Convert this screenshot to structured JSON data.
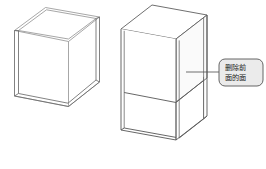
{
  "figure": {
    "background_color": "#ffffff",
    "line_color": "#6b6b6b",
    "line_color_dark": "#4a4a4a",
    "face_fill": "#ffffff",
    "shading_fill": "#f7f7f7"
  },
  "objects": [
    {
      "name": "left-box-wireframe",
      "label": "wireframe shell box",
      "style": "transparent thin-walled open box, all edges visible"
    },
    {
      "name": "right-box-solid",
      "label": "shaded shell box with front face removed",
      "style": "opaque faces, front face deleted revealing interior"
    }
  ],
  "callout": {
    "text_line_1": "删除前",
    "text_line_2": "面的面",
    "full_text": "删除前面的面",
    "fill_color": "#ebebeb",
    "border_color": "#555555",
    "leader_line": "connects callout to right box right vertical edge"
  }
}
